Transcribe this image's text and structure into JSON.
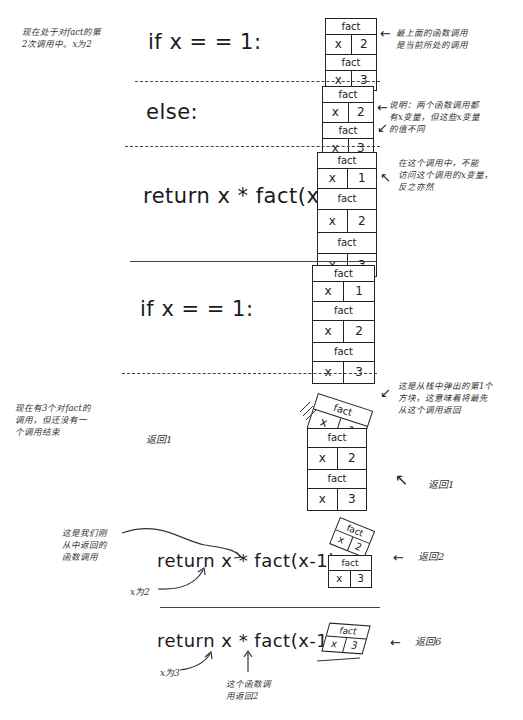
{
  "notes": {
    "top_left": "现在处于对fact的第\n2次调用中。x为2",
    "top_right": "最上面的函数调用\n是当前所处的调用",
    "else_right": "说明：两个函数调用都\n有x变量，但这些x变量\n的值不同",
    "return_right": "在这个调用中，不能\n访问这个调用的x变量，\n反之亦然",
    "mid_left": "现在有3个对fact的\n调用，但还没有一\n个调用结束",
    "pop_right": "这是从栈中弹出的第1个\n方块，这意味着将最先\n从这个调用返回",
    "return1_left": "返回1",
    "return1_right": "返回1",
    "just_returned": "这是我们刚\n从中返回的\n函数调用",
    "x_is_2": "x为2",
    "return2": "返回2",
    "x_is_3": "x为3",
    "call_returned_2": "这个函数调\n用返回2",
    "return6": "返回6"
  },
  "code": {
    "line1": "if x = = 1:",
    "line2": "else:",
    "line3": "return x * fact(x-1)",
    "line4": "if x = = 1:",
    "line5": "return x * fact(x-1)",
    "line6": "return x * fact(x-1)"
  },
  "stacks": {
    "s1": [
      {
        "name": "fact",
        "var": "x",
        "val": "2"
      },
      {
        "name": "fact",
        "var": "x",
        "val": "3"
      }
    ],
    "s2": [
      {
        "name": "fact",
        "var": "x",
        "val": "2"
      },
      {
        "name": "fact",
        "var": "x",
        "val": "3"
      }
    ],
    "s3": [
      {
        "name": "fact",
        "var": "x",
        "val": "1"
      },
      {
        "name": "fact",
        "var": "x",
        "val": "2"
      },
      {
        "name": "fact",
        "var": "x",
        "val": "3"
      }
    ],
    "s4": [
      {
        "name": "fact",
        "var": "x",
        "val": "1"
      },
      {
        "name": "fact",
        "var": "x",
        "val": "2"
      },
      {
        "name": "fact",
        "var": "x",
        "val": "3"
      }
    ],
    "s5_popped": {
      "name": "fact",
      "var": "x",
      "val": "1"
    },
    "s5": [
      {
        "name": "fact",
        "var": "x",
        "val": "2"
      },
      {
        "name": "fact",
        "var": "x",
        "val": "3"
      }
    ],
    "s6_popped": {
      "name": "fact",
      "var": "x",
      "val": "2"
    },
    "s6": [
      {
        "name": "fact",
        "var": "x",
        "val": "3"
      }
    ],
    "s7_popped": {
      "name": "fact",
      "var": "x",
      "val": "3"
    }
  },
  "arrows": {
    "left": "←",
    "nw": "↖",
    "sw": "↙"
  }
}
